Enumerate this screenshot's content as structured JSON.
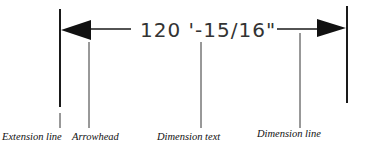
{
  "diagram": {
    "dimension_text": "120 '-15/16\"",
    "labels": {
      "extension_line": "Extension line",
      "arrowhead": "Arrowhead",
      "dimension_text": "Dimension text",
      "dimension_line": "Dimension line"
    },
    "colors": {
      "line": "#1a1a1a",
      "text": "#333333",
      "background": "#ffffff"
    }
  }
}
